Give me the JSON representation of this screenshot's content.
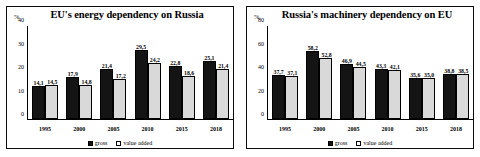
{
  "page": {
    "background": "#ffffff",
    "gross_color": "#141414",
    "value_added_color": "#d9d9d9"
  },
  "legend": {
    "gross_label": "gross",
    "value_added_label": "value added"
  },
  "charts": [
    {
      "id": "eu-energy-dependency-on-russia",
      "title": "EU's energy dependency on Russia",
      "unit_label": "%",
      "chart_data": {
        "type": "bar",
        "title": "EU's energy dependency on Russia",
        "xlabel": "",
        "ylabel": "%",
        "ylim": [
          0,
          40
        ],
        "yticks": [
          0,
          10,
          20,
          30,
          40
        ],
        "ytick_labels": [
          "0",
          "10",
          "20",
          "30",
          "40"
        ],
        "grid": false,
        "legend_position": "bottom",
        "categories": [
          "1995",
          "2000",
          "2005",
          "2010",
          "2015",
          "2018"
        ],
        "series": [
          {
            "name": "gross",
            "values": [
              14.1,
              17.9,
              21.4,
              29.5,
              22.8,
              25.1
            ],
            "labels": [
              "14,1",
              "17,9",
              "21,4",
              "29,5",
              "22,8",
              "25,1"
            ]
          },
          {
            "name": "value added",
            "values": [
              14.5,
              14.8,
              17.2,
              24.2,
              18.6,
              21.4
            ],
            "labels": [
              "14,5",
              "14,8",
              "17,2",
              "24,2",
              "18,6",
              "21,4"
            ]
          }
        ]
      }
    },
    {
      "id": "russia-machinery-dependency-on-eu",
      "title": "Russia's machinery dependency on EU",
      "unit_label": "%",
      "chart_data": {
        "type": "bar",
        "title": "Russia's machinery dependency on EU",
        "xlabel": "",
        "ylabel": "%",
        "ylim": [
          0,
          80
        ],
        "yticks": [
          0,
          20,
          40,
          60,
          80
        ],
        "ytick_labels": [
          "0",
          "20",
          "40",
          "60",
          "80"
        ],
        "grid": false,
        "legend_position": "bottom",
        "categories": [
          "1995",
          "2000",
          "2005",
          "2010",
          "2015",
          "2018"
        ],
        "series": [
          {
            "name": "gross",
            "values": [
              37.7,
              58.2,
              46.9,
              43.3,
              35.6,
              38.8
            ],
            "labels": [
              "37,7",
              "58,2",
              "46,9",
              "43,3",
              "35,6",
              "38,8"
            ]
          },
          {
            "name": "value added",
            "values": [
              37.1,
              52.8,
              44.5,
              42.1,
              35.0,
              38.5
            ],
            "labels": [
              "37,1",
              "52,8",
              "44,5",
              "42,1",
              "35,0",
              "38,5"
            ]
          }
        ]
      }
    }
  ]
}
